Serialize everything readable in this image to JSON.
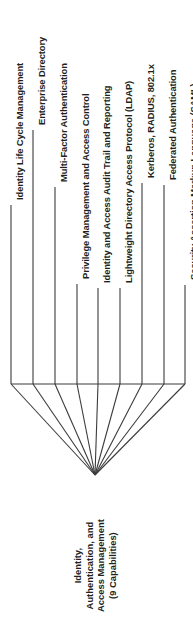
{
  "diagram": {
    "type": "fan-convergence-tree",
    "orientation": "rotated-90-ccw",
    "root": {
      "name": "root-node",
      "lines": [
        "Identity,",
        "Authentication, and",
        "Access Management",
        "(9 Capabilities)"
      ],
      "full_text": "Identity, Authentication, and Access Management (9 Capabilities)",
      "capability_count": "9"
    },
    "capabilities": [
      {
        "label": "Identity Life Cycle Management"
      },
      {
        "label": "Enterprise Directory"
      },
      {
        "label": "Multi-Factor Authentication"
      },
      {
        "label": "Privilege Management and Access Control"
      },
      {
        "label": "Identity and Access Audit Trail and Reporting"
      },
      {
        "label": "Lightweight Directory Access Protocol (LDAP)"
      },
      {
        "label": "Kerberos, RADIUS, 802.1x"
      },
      {
        "label": "Federated Authentication"
      },
      {
        "label": "Security Assertion Markup Language (SAML)"
      }
    ],
    "colors": {
      "text": "#231f20",
      "line": "#3b3b3b",
      "background": "#ffffff"
    }
  }
}
